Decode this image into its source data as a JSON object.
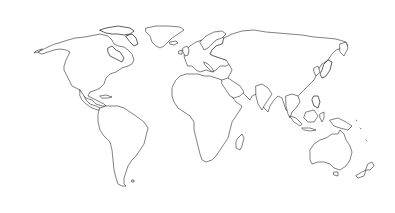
{
  "map": {
    "type": "world-outline",
    "projection": "equirectangular-like",
    "background_color": "#ffffff",
    "outline_color": "#2b2b2b",
    "labels": [],
    "regions": [
      {
        "id": "north-america",
        "name": "North America"
      },
      {
        "id": "greenland",
        "name": "Greenland"
      },
      {
        "id": "south-america",
        "name": "South America"
      },
      {
        "id": "europe",
        "name": "Europe"
      },
      {
        "id": "africa",
        "name": "Africa"
      },
      {
        "id": "asia",
        "name": "Asia"
      },
      {
        "id": "australia",
        "name": "Australia"
      },
      {
        "id": "new-zealand",
        "name": "New Zealand"
      },
      {
        "id": "madagascar",
        "name": "Madagascar"
      },
      {
        "id": "japan",
        "name": "Japan"
      },
      {
        "id": "indonesia",
        "name": "Indonesia"
      },
      {
        "id": "new-guinea",
        "name": "New Guinea"
      },
      {
        "id": "uk",
        "name": "British Isles"
      },
      {
        "id": "iceland",
        "name": "Iceland"
      },
      {
        "id": "arctic-archipelago",
        "name": "Canadian Arctic Archipelago"
      }
    ]
  }
}
